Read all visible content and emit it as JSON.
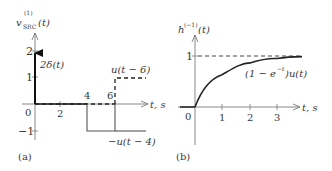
{
  "panel_a": {
    "caption": "(a)",
    "y_label_main": "v",
    "y_label_sup": "(1)",
    "y_label_sub": "SRC",
    "y_label_arg": "(t)",
    "x_label": "t, s",
    "y_ticks": [
      "2",
      "1",
      "−1"
    ],
    "x_ticks": [
      "0",
      "2",
      "4",
      "6"
    ],
    "impulse_label": "2δ(t)",
    "step_pos_label": "u(t − 6)",
    "step_neg_label": "−u(t − 4)"
  },
  "panel_b": {
    "caption": "(b)",
    "y_label_main": "h",
    "y_label_sup": "(−1)",
    "y_label_arg": "(t)",
    "x_label": "t, s",
    "y_ticks": [
      "1"
    ],
    "x_ticks": [
      "0",
      "1",
      "2",
      "3"
    ],
    "curve_label": "(1 − e",
    "curve_label_sup": "−t",
    "curve_label_tail": ")u(t)"
  },
  "colors": {
    "axis": "#7a7a7a",
    "curve": "#222222",
    "text": "#3a3a3a"
  }
}
